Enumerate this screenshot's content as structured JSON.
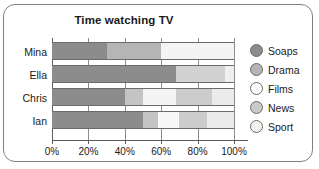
{
  "chart_data": {
    "type": "bar",
    "subtype": "stacked-horizontal-100-percent",
    "title": "Time watching TV",
    "xlabel": "",
    "ylabel": "",
    "xlim": [
      0,
      100
    ],
    "xticks": [
      0,
      20,
      40,
      60,
      80,
      100
    ],
    "xtick_labels": [
      "0%",
      "20%",
      "40%",
      "60%",
      "80%",
      "100%"
    ],
    "grid": true,
    "legend_position": "right",
    "categories": [
      "Mina",
      "Ella",
      "Chris",
      "Ian"
    ],
    "series": [
      {
        "name": "Soaps",
        "color": "#8c8c8c",
        "values": [
          30,
          68,
          40,
          50
        ]
      },
      {
        "name": "Drama",
        "color": "#b5b5b5",
        "values": [
          30,
          0,
          10,
          8
        ]
      },
      {
        "name": "Films",
        "color": "#f2f2f2",
        "values": [
          40,
          0,
          18,
          12
        ]
      },
      {
        "name": "News",
        "color": "#c9c9c9",
        "values": [
          0,
          27,
          20,
          15
        ]
      },
      {
        "name": "Sport",
        "color": "#ededed",
        "values": [
          0,
          5,
          12,
          15
        ]
      }
    ],
    "stacks": [
      {
        "category": "Mina",
        "segments": [
          {
            "name": "Soaps",
            "value": 30,
            "color": "#8c8c8c"
          },
          {
            "name": "Drama",
            "value": 30,
            "color": "#b5b5b5"
          },
          {
            "name": "Films",
            "value": 40,
            "color": "#f4f4f4"
          }
        ]
      },
      {
        "category": "Ella",
        "segments": [
          {
            "name": "Soaps",
            "value": 68,
            "color": "#8c8c8c"
          },
          {
            "name": "News",
            "value": 27,
            "color": "#d2d2d2"
          },
          {
            "name": "Sport",
            "value": 5,
            "color": "#efefef"
          }
        ]
      },
      {
        "category": "Chris",
        "segments": [
          {
            "name": "Soaps",
            "value": 40,
            "color": "#8c8c8c"
          },
          {
            "name": "Drama",
            "value": 10,
            "color": "#c4c4c4"
          },
          {
            "name": "Films",
            "value": 18,
            "color": "#f4f4f4"
          },
          {
            "name": "News",
            "value": 20,
            "color": "#cccccc"
          },
          {
            "name": "Sport",
            "value": 12,
            "color": "#ebebeb"
          }
        ]
      },
      {
        "category": "Ian",
        "segments": [
          {
            "name": "Soaps",
            "value": 50,
            "color": "#8c8c8c"
          },
          {
            "name": "Drama",
            "value": 8,
            "color": "#c4c4c4"
          },
          {
            "name": "Films",
            "value": 12,
            "color": "#f7f7f7"
          },
          {
            "name": "News",
            "value": 15,
            "color": "#cccccc"
          },
          {
            "name": "Sport",
            "value": 15,
            "color": "#ebebeb"
          }
        ]
      }
    ],
    "legend": [
      {
        "label": "Soaps",
        "color": "#8c8c8c"
      },
      {
        "label": "Drama",
        "color": "#b5b5b5"
      },
      {
        "label": "Films",
        "color": "#fbfbfb"
      },
      {
        "label": "News",
        "color": "#c9c9c9"
      },
      {
        "label": "Sport",
        "color": "#f2f2f2"
      }
    ]
  }
}
